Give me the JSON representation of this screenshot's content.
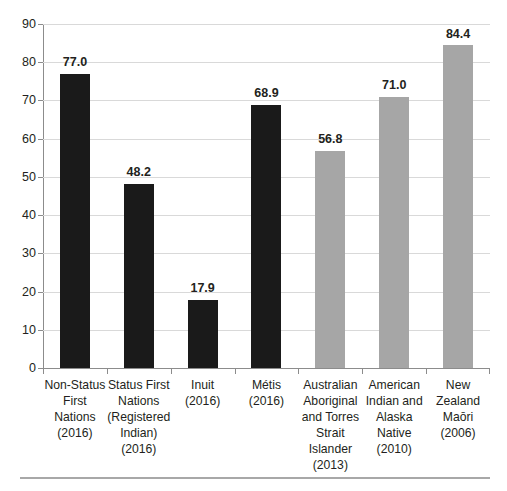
{
  "chart_data": {
    "type": "bar",
    "title": "",
    "subtitle": "",
    "xlabel": "",
    "ylabel": "",
    "ylim": [
      0,
      90
    ],
    "ytick_step": 10,
    "yticks": [
      0,
      10,
      20,
      30,
      40,
      50,
      60,
      70,
      80,
      90
    ],
    "grid": true,
    "grid_axis": "y",
    "legend": "none",
    "categories": [
      "Non-Status First Nations (2016)",
      "Status First Nations (Registered Indian) (2016)",
      "Inuit (2016)",
      "Métis (2016)",
      "Australian Aboriginal and Torres Strait Islander (2013)",
      "American Indian and Alaska Native (2010)",
      "New Zealand Maōri (2006)"
    ],
    "category_lines": [
      [
        "Non-Status",
        "First",
        "Nations",
        "(2016)"
      ],
      [
        "Status First",
        "Nations",
        "(Registered",
        "Indian)",
        "(2016)"
      ],
      [
        "Inuit",
        "(2016)"
      ],
      [
        "Métis",
        "(2016)"
      ],
      [
        "Australian",
        "Aboriginal",
        "and Torres",
        "Strait",
        "Islander",
        "(2013)"
      ],
      [
        "American",
        "Indian and",
        "Alaska",
        "Native",
        "(2010)"
      ],
      [
        "New",
        "Zealand",
        "Maōri",
        "(2006)"
      ]
    ],
    "values": [
      77.0,
      48.2,
      17.9,
      68.9,
      56.8,
      71.0,
      84.4
    ],
    "value_labels": [
      "77.0",
      "48.2",
      "17.9",
      "68.9",
      "56.8",
      "71.0",
      "84.4"
    ],
    "bar_colors": [
      "#1a1a1a",
      "#1a1a1a",
      "#1a1a1a",
      "#1a1a1a",
      "#a6a6a6",
      "#a6a6a6",
      "#a6a6a6"
    ]
  },
  "colors": {
    "bar_dark": "#1a1a1a",
    "bar_light": "#a6a6a6",
    "gridline": "#d9d9d9",
    "axis": "#8c8c8c",
    "text": "#231f20",
    "footer_rule": "#a8a8a8",
    "background": "#ffffff"
  }
}
